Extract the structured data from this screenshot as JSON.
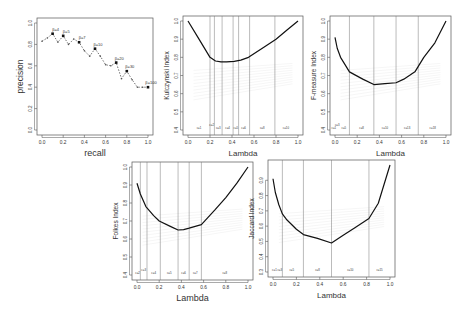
{
  "chart_data": [
    {
      "id": "pr",
      "type": "line",
      "title": "",
      "xlabel": "recall",
      "ylabel": "precision",
      "xlim": [
        0.0,
        1.0
      ],
      "ylim": [
        0.0,
        1.0
      ],
      "xticks": [
        "0.0",
        "0.2",
        "0.4",
        "0.6",
        "0.8",
        "1.0"
      ],
      "yticks": [
        "0.0",
        "0.2",
        "0.4",
        "0.6",
        "0.8",
        "1.0"
      ],
      "grid": false,
      "line_style": "dashed",
      "x": [
        0.0,
        0.05,
        0.1,
        0.15,
        0.2,
        0.25,
        0.3,
        0.35,
        0.4,
        0.45,
        0.5,
        0.55,
        0.6,
        0.65,
        0.7,
        0.75,
        0.8,
        0.85,
        0.9,
        0.95,
        1.0
      ],
      "y": [
        0.83,
        0.86,
        0.9,
        0.82,
        0.88,
        0.8,
        0.85,
        0.82,
        0.74,
        0.69,
        0.76,
        0.69,
        0.61,
        0.6,
        0.63,
        0.48,
        0.55,
        0.47,
        0.4,
        0.4,
        0.4
      ],
      "annotations": [
        {
          "x": 0.1,
          "y": 0.9,
          "text": "β=4"
        },
        {
          "x": 0.2,
          "y": 0.88,
          "text": "β=5"
        },
        {
          "x": 0.35,
          "y": 0.82,
          "text": "β=7"
        },
        {
          "x": 0.5,
          "y": 0.76,
          "text": "β=10"
        },
        {
          "x": 0.7,
          "y": 0.63,
          "text": "β=20"
        },
        {
          "x": 0.8,
          "y": 0.55,
          "text": "β=30"
        },
        {
          "x": 1.0,
          "y": 0.4,
          "text": "β=100"
        }
      ]
    },
    {
      "id": "kulczynski",
      "type": "line",
      "xlabel": "Lambda",
      "ylabel": "Kulczynski Index",
      "xlim": [
        0.0,
        1.0
      ],
      "ylim": [
        0.4,
        1.0
      ],
      "xticks": [
        "0.0",
        "0.2",
        "0.4",
        "0.6",
        "0.8",
        "1.0"
      ],
      "yticks": [
        "0.4",
        "0.5",
        "0.6",
        "0.7",
        "0.8",
        "0.9",
        "1.0"
      ],
      "x": [
        0.0,
        0.1,
        0.2,
        0.25,
        0.3,
        0.35,
        0.42,
        0.48,
        0.55,
        0.7,
        0.8,
        0.9,
        1.0
      ],
      "y": [
        1.0,
        0.9,
        0.8,
        0.78,
        0.775,
        0.775,
        0.778,
        0.785,
        0.8,
        0.86,
        0.9,
        0.95,
        1.0
      ],
      "vlines": [
        0.2,
        0.24,
        0.31,
        0.41,
        0.46,
        0.56,
        0.79
      ],
      "region_labels": [
        {
          "x": 0.1,
          "text": "c=1"
        },
        {
          "x": 0.215,
          "text": "c=2",
          "raised": true
        },
        {
          "x": 0.275,
          "text": "c=3"
        },
        {
          "x": 0.36,
          "text": "c=4"
        },
        {
          "x": 0.435,
          "text": "c=5"
        },
        {
          "x": 0.505,
          "text": "c=6"
        },
        {
          "x": 0.675,
          "text": "c=8"
        },
        {
          "x": 0.89,
          "text": "c=10"
        }
      ]
    },
    {
      "id": "fmeasure",
      "type": "line",
      "xlabel": "Lambda",
      "ylabel": "F-measure Index",
      "xlim": [
        0.0,
        1.0
      ],
      "ylim": [
        0.4,
        1.0
      ],
      "xticks": [
        "0.0",
        "0.2",
        "0.4",
        "0.6",
        "0.8",
        "1.0"
      ],
      "yticks": [
        "0.4",
        "0.5",
        "0.6",
        "0.7",
        "0.8",
        "0.9",
        "1.0"
      ],
      "x": [
        0.0,
        0.02,
        0.05,
        0.1,
        0.13,
        0.25,
        0.35,
        0.45,
        0.55,
        0.62,
        0.72,
        0.8,
        0.9,
        1.0
      ],
      "y": [
        0.91,
        0.85,
        0.8,
        0.75,
        0.72,
        0.68,
        0.65,
        0.655,
        0.66,
        0.68,
        0.72,
        0.8,
        0.88,
        1.0
      ],
      "vlines": [
        0.13,
        0.35,
        0.55,
        0.75
      ],
      "region_labels": [
        {
          "x": -0.01,
          "text": "c=1"
        },
        {
          "x": 0.02,
          "text": "c=3",
          "raised": true
        },
        {
          "x": 0.08,
          "text": "c=5"
        },
        {
          "x": 0.24,
          "text": "c=8"
        },
        {
          "x": 0.45,
          "text": "c=10"
        },
        {
          "x": 0.65,
          "text": "c=13"
        },
        {
          "x": 0.88,
          "text": "c=18"
        }
      ]
    },
    {
      "id": "folkes",
      "type": "line",
      "xlabel": "Lambda",
      "ylabel": "Folkes Index",
      "xlim": [
        0.0,
        1.0
      ],
      "ylim": [
        0.4,
        1.0
      ],
      "xticks": [
        "0.0",
        "0.2",
        "0.4",
        "0.6",
        "0.8",
        "1.0"
      ],
      "yticks": [
        "0.4",
        "0.5",
        "0.6",
        "0.7",
        "0.8",
        "0.9",
        "1.0"
      ],
      "x": [
        0.0,
        0.03,
        0.08,
        0.15,
        0.2,
        0.3,
        0.37,
        0.42,
        0.47,
        0.58,
        0.7,
        0.8,
        0.9,
        1.0
      ],
      "y": [
        0.91,
        0.85,
        0.78,
        0.73,
        0.7,
        0.67,
        0.65,
        0.652,
        0.66,
        0.68,
        0.76,
        0.83,
        0.91,
        1.0
      ],
      "vlines": [
        0.03,
        0.09,
        0.21,
        0.37,
        0.47,
        0.58
      ],
      "region_labels": [
        {
          "x": 0.005,
          "text": "c=2"
        },
        {
          "x": 0.06,
          "text": "c=3",
          "raised": true
        },
        {
          "x": 0.15,
          "text": "c=4"
        },
        {
          "x": 0.29,
          "text": "c=5"
        },
        {
          "x": 0.42,
          "text": "c=6"
        },
        {
          "x": 0.525,
          "text": "c=7"
        },
        {
          "x": 0.79,
          "text": "c=8"
        }
      ]
    },
    {
      "id": "jaccard",
      "type": "line",
      "xlabel": "Lambda",
      "ylabel": "Jaccard Index",
      "xlim": [
        0.0,
        1.0
      ],
      "ylim": [
        0.3,
        1.0
      ],
      "xticks": [
        "0.0",
        "0.2",
        "0.4",
        "0.6",
        "0.8",
        "1.0"
      ],
      "yticks": [
        "0.3",
        "0.4",
        "0.5",
        "0.6",
        "0.7",
        "0.8",
        "0.9"
      ],
      "x": [
        0.0,
        0.02,
        0.05,
        0.08,
        0.12,
        0.2,
        0.26,
        0.38,
        0.5,
        0.6,
        0.7,
        0.82,
        0.9,
        1.0
      ],
      "y": [
        0.91,
        0.82,
        0.74,
        0.68,
        0.64,
        0.58,
        0.545,
        0.52,
        0.49,
        0.54,
        0.59,
        0.65,
        0.75,
        1.0
      ],
      "vlines": [
        0.08,
        0.26,
        0.5,
        0.82
      ],
      "region_labels": [
        {
          "x": 0.035,
          "text": "c=1 c=3"
        },
        {
          "x": 0.16,
          "text": "c=5"
        },
        {
          "x": 0.38,
          "text": "c=8"
        },
        {
          "x": 0.66,
          "text": "c=10"
        },
        {
          "x": 0.91,
          "text": "c=15"
        }
      ]
    }
  ],
  "panels": [
    {
      "chart": 0,
      "left": 2,
      "top": 4,
      "plot": {
        "x": 37,
        "y": 18,
        "w": 116,
        "h": 117
      }
    },
    {
      "chart": 1,
      "left": 155,
      "top": 4,
      "plot": {
        "x": 183,
        "y": 16,
        "w": 120,
        "h": 119
      }
    },
    {
      "chart": 2,
      "left": 308,
      "top": 4,
      "plot": {
        "x": 330,
        "y": 16,
        "w": 121,
        "h": 119
      }
    },
    {
      "chart": 3,
      "left": 110,
      "top": 158,
      "plot": {
        "x": 132,
        "y": 162,
        "w": 121,
        "h": 118
      }
    },
    {
      "chart": 4,
      "left": 258,
      "top": 158,
      "plot": {
        "x": 268,
        "y": 160,
        "w": 127,
        "h": 117
      }
    }
  ]
}
